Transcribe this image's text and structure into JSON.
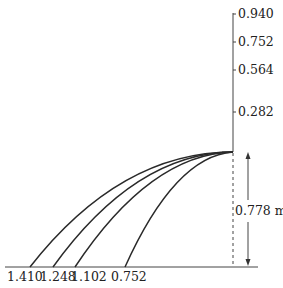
{
  "diagram": {
    "vertical_axis": {
      "ticks": [
        {
          "label": "0.940",
          "y": 14
        },
        {
          "label": "0.752",
          "y": 42
        },
        {
          "label": "0.564",
          "y": 70
        },
        {
          "label": "0.282",
          "y": 112
        }
      ]
    },
    "ground_labels": [
      {
        "label": "1.410",
        "x": 30
      },
      {
        "label": "1.248",
        "x": 53
      },
      {
        "label": "1.102",
        "x": 75
      },
      {
        "label": "0.752",
        "x": 125
      }
    ],
    "height_dimension": {
      "label": "0.778 m"
    },
    "trajectories": [
      {
        "name": "trajectory-1410",
        "landing": "1.410"
      },
      {
        "name": "trajectory-1248",
        "landing": "1.248"
      },
      {
        "name": "trajectory-1102",
        "landing": "1.102"
      },
      {
        "name": "trajectory-0752",
        "landing": "0.752"
      }
    ]
  }
}
